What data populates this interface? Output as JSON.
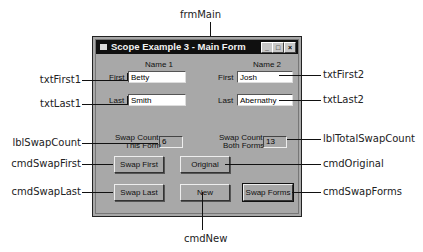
{
  "diagram": {
    "form_callout": "frmMain",
    "bottom_callout": "cmdNew",
    "left_callouts": [
      "txtFirst1",
      "txtLast1",
      "lblSwapCount",
      "cmdSwapFirst",
      "cmdSwapLast"
    ],
    "right_callouts": [
      "txtFirst2",
      "txtLast2",
      "lblTotalSwapCount",
      "cmdOriginal",
      "cmdSwapForms"
    ]
  },
  "window": {
    "title": "Scope Example 3 - Main Form",
    "controls": {
      "minimize": "_",
      "maximize": "□",
      "close": "×"
    }
  },
  "name1": {
    "heading": "Name 1",
    "first_label": "First",
    "first_value": "Betty",
    "last_label": "Last",
    "last_value": "Smith",
    "swap_label_line1": "Swap Count",
    "swap_label_line2": "This Form",
    "swap_count": "6"
  },
  "name2": {
    "heading": "Name 2",
    "first_label": "First",
    "first_value": "Josh",
    "last_label": "Last",
    "last_value": "Abernathy",
    "swap_label_line1": "Swap Count",
    "swap_label_line2": "Both Forms",
    "swap_count": "13"
  },
  "buttons": {
    "swap_first": "Swap First",
    "original": "Original",
    "swap_last": "Swap Last",
    "new": "New",
    "swap_forms": "Swap Forms"
  }
}
